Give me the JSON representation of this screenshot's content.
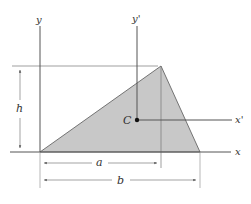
{
  "diagram": {
    "type": "triangle-centroid-geometry",
    "colors": {
      "fill": "#c8c8c8",
      "stroke": "#555555",
      "axis": "#555555",
      "dim": "#777777",
      "background": "#ffffff"
    },
    "axes": {
      "y_label": "y",
      "x_label": "x",
      "y_prime_label": "y'",
      "x_prime_label": "x'"
    },
    "centroid_label": "C",
    "dimensions": {
      "height_label": "h",
      "a_label": "a",
      "b_label": "b"
    }
  }
}
